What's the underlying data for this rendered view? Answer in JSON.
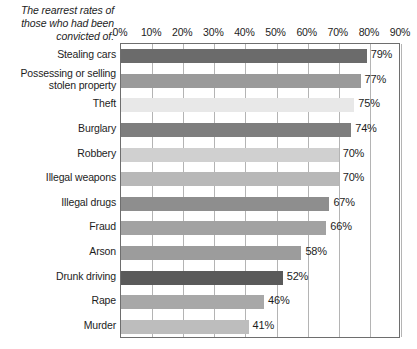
{
  "chart_data": {
    "type": "bar",
    "title": "The rearrest rates of those who had been convicted of:",
    "orientation": "horizontal",
    "xlabel": "",
    "ylabel": "",
    "xlim": [
      0,
      90
    ],
    "grid": true,
    "legend": false,
    "x_ticks": [
      "0%",
      "10%",
      "20%",
      "30%",
      "40%",
      "50%",
      "60%",
      "70%",
      "80%",
      "90%"
    ],
    "x_tick_values": [
      0,
      10,
      20,
      30,
      40,
      50,
      60,
      70,
      80,
      90
    ],
    "categories": [
      "Stealing cars",
      "Possessing or selling stolen property",
      "Theft",
      "Burglary",
      "Robbery",
      "Illegal weapons",
      "Illegal drugs",
      "Fraud",
      "Arson",
      "Drunk driving",
      "Rape",
      "Murder"
    ],
    "values": [
      79,
      77,
      75,
      74,
      70,
      70,
      67,
      66,
      58,
      52,
      46,
      41
    ],
    "value_labels": [
      "79%",
      "77%",
      "75%",
      "74%",
      "70%",
      "70%",
      "67%",
      "66%",
      "58%",
      "52%",
      "46%",
      "41%"
    ],
    "bar_colors": [
      "#6b6b6b",
      "#9a9a9a",
      "#e8e8e8",
      "#7e7e7e",
      "#d0d0d0",
      "#b8b8b8",
      "#8e8e8e",
      "#a2a2a2",
      "#9c9c9c",
      "#5a5a5a",
      "#a8a8a8",
      "#bdbdbd"
    ]
  },
  "colors": {
    "plot_border": "#6e6e6e",
    "gridline": "#b4b4b4",
    "text": "#1d1d1d",
    "background": "#ffffff"
  }
}
